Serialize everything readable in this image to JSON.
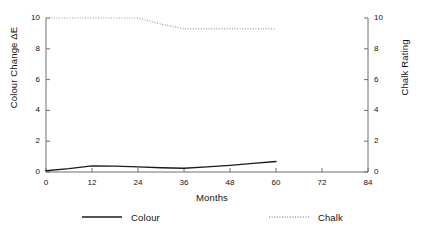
{
  "chart_data": {
    "type": "line",
    "title": "",
    "xlabel": "Months",
    "ylabel": "Colour Change ΔE",
    "ylabel_right": "Chalk Rating",
    "xlim": [
      0,
      84
    ],
    "ylim": [
      0,
      10
    ],
    "ylim_right": [
      0,
      10
    ],
    "xticks": [
      0,
      12,
      24,
      36,
      48,
      60,
      72,
      84
    ],
    "xtick_labels": [
      "0",
      "12",
      "24",
      "36",
      "48",
      "60",
      "72",
      "84"
    ],
    "yticks": [
      0,
      2,
      4,
      6,
      8,
      10
    ],
    "ytick_labels": [
      "0",
      "2",
      "4",
      "6",
      "8",
      "10"
    ],
    "yticks_right": [
      0,
      2,
      4,
      6,
      8,
      10
    ],
    "ytick_labels_right": [
      "0",
      "2",
      "4",
      "6",
      "8",
      "10"
    ],
    "grid": false,
    "legend_position": "below",
    "series": [
      {
        "name": "Colour",
        "axis": "left",
        "style": "solid",
        "color": "#1a1a1a",
        "x": [
          0,
          6,
          12,
          18,
          24,
          30,
          36,
          42,
          48,
          54,
          60
        ],
        "values": [
          0.08,
          0.22,
          0.4,
          0.38,
          0.33,
          0.28,
          0.24,
          0.33,
          0.43,
          0.56,
          0.68
        ]
      },
      {
        "name": "Chalk",
        "axis": "right",
        "style": "dotted",
        "color": "#9a9a9a",
        "x": [
          0,
          6,
          12,
          18,
          24,
          30,
          36,
          42,
          48,
          54,
          60
        ],
        "values": [
          10.0,
          10.0,
          10.0,
          10.0,
          10.0,
          9.6,
          9.3,
          9.3,
          9.3,
          9.3,
          9.3
        ]
      }
    ]
  },
  "legend": {
    "entries": [
      {
        "label": "Colour",
        "style": "solid"
      },
      {
        "label": "Chalk",
        "style": "dotted"
      }
    ]
  },
  "colors": {
    "axis": "#6e6e6e",
    "colour_series": "#1a1a1a",
    "chalk_series": "#9a9a9a",
    "text": "#111111",
    "background": "#ffffff"
  }
}
